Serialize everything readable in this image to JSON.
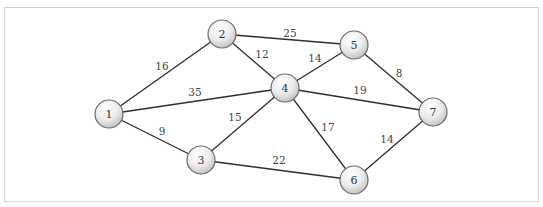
{
  "diagram": {
    "type": "weighted-undirected-graph",
    "nodes": [
      {
        "id": "1",
        "label": "1",
        "x": 109,
        "y": 114
      },
      {
        "id": "2",
        "label": "2",
        "x": 222,
        "y": 34
      },
      {
        "id": "3",
        "label": "3",
        "x": 201,
        "y": 160
      },
      {
        "id": "4",
        "label": "4",
        "x": 285,
        "y": 88
      },
      {
        "id": "5",
        "label": "5",
        "x": 354,
        "y": 45
      },
      {
        "id": "6",
        "label": "6",
        "x": 354,
        "y": 180
      },
      {
        "id": "7",
        "label": "7",
        "x": 433,
        "y": 112
      }
    ],
    "edges": [
      {
        "from": "1",
        "to": "2",
        "weight": "16",
        "lx": 162,
        "ly": 66
      },
      {
        "from": "1",
        "to": "4",
        "weight": "35",
        "lx": 195,
        "ly": 92
      },
      {
        "from": "1",
        "to": "3",
        "weight": "9",
        "lx": 162,
        "ly": 131
      },
      {
        "from": "2",
        "to": "5",
        "weight": "25",
        "lx": 290,
        "ly": 33
      },
      {
        "from": "2",
        "to": "4",
        "weight": "12",
        "lx": 262,
        "ly": 54
      },
      {
        "from": "3",
        "to": "4",
        "weight": "15",
        "lx": 235,
        "ly": 117
      },
      {
        "from": "3",
        "to": "6",
        "weight": "22",
        "lx": 279,
        "ly": 160
      },
      {
        "from": "4",
        "to": "5",
        "weight": "14",
        "lx": 315,
        "ly": 58
      },
      {
        "from": "4",
        "to": "7",
        "weight": "19",
        "lx": 360,
        "ly": 90
      },
      {
        "from": "4",
        "to": "6",
        "weight": "17",
        "lx": 328,
        "ly": 127
      },
      {
        "from": "5",
        "to": "7",
        "weight": "8",
        "lx": 399,
        "ly": 73
      },
      {
        "from": "6",
        "to": "7",
        "weight": "14",
        "lx": 387,
        "ly": 139
      }
    ],
    "node_radius": 14,
    "colors": {
      "edge": "#2e2e2e",
      "node_stroke": "#6a6a6a",
      "node_fill_light": "#ffffff",
      "node_fill_dark": "#c8c8c8",
      "frame_border": "#d4d4d4"
    }
  }
}
